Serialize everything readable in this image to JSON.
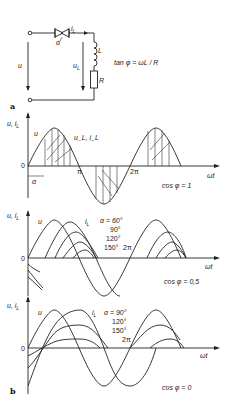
{
  "circuit": {
    "label_a": "a",
    "current": "i",
    "current_sub": "L",
    "firing_angle": "α",
    "inductor": "L",
    "resistor": "R",
    "source_voltage": "u",
    "load_voltage": "u",
    "load_voltage_sub": "L",
    "formula": "tan φ = ωL / R"
  },
  "label_b": "b",
  "charts": [
    {
      "ylabel": "u, i",
      "ylabel_sub": "L",
      "origin": "0",
      "xlabel": "ωt",
      "curve_u": "u",
      "curve_load": "u_L, i_L",
      "alpha_marker": "α",
      "pi": "π",
      "two_pi": "2π",
      "condition": "cos φ = 1"
    },
    {
      "ylabel": "u, i",
      "ylabel_sub": "L",
      "origin": "0",
      "xlabel": "ωt",
      "curve_u": "u",
      "curve_i": "i",
      "curve_i_sub": "L",
      "alpha_labels": [
        "α = 60°",
        "90°",
        "120°",
        "150°"
      ],
      "two_pi": "2π",
      "condition": "cos φ = 0,5"
    },
    {
      "ylabel": "u, i",
      "ylabel_sub": "L",
      "origin": "0",
      "xlabel": "ωt",
      "curve_u": "u",
      "curve_i": "i",
      "curve_i_sub": "L",
      "alpha_labels": [
        "α = 90°",
        "120°",
        "150°"
      ],
      "two_pi": "2π",
      "condition": "cos φ = 0"
    }
  ]
}
